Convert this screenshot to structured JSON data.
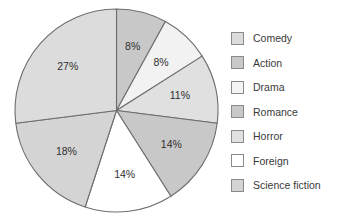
{
  "chart_data": {
    "type": "pie",
    "title": "",
    "subtitle": "",
    "xlabel": "",
    "ylabel": "",
    "grid": false,
    "legend_position": "right",
    "start_angle_deg": 90,
    "direction": "clockwise",
    "categories": [
      "Comedy",
      "Action",
      "Drama",
      "Romance",
      "Horror",
      "Foreign",
      "Science fiction"
    ],
    "values": [
      27,
      8,
      8,
      14,
      11,
      14,
      18
    ],
    "unit": "%",
    "slices": [
      {
        "label": "Action",
        "value": 8,
        "data_label": "8%",
        "color": "#c8c8c8",
        "order_clockwise": 1
      },
      {
        "label": "Drama",
        "value": 8,
        "data_label": "8%",
        "color": "#f2f2f2",
        "order_clockwise": 2
      },
      {
        "label": "Horror",
        "value": 11,
        "data_label": "11%",
        "color": "#e0e0e0",
        "order_clockwise": 3
      },
      {
        "label": "Romance",
        "value": 14,
        "data_label": "14%",
        "color": "#c8c8c8",
        "order_clockwise": 4
      },
      {
        "label": "Foreign",
        "value": 14,
        "data_label": "14%",
        "color": "#ffffff",
        "order_clockwise": 5
      },
      {
        "label": "Science fiction",
        "value": 18,
        "data_label": "18%",
        "color": "#d4d4d4",
        "order_clockwise": 6
      },
      {
        "label": "Comedy",
        "value": 27,
        "data_label": "27%",
        "color": "#dcdcdc",
        "order_clockwise": 7
      }
    ],
    "data_labels": [
      "8%",
      "8%",
      "11%",
      "14%",
      "14%",
      "18%",
      "27%"
    ],
    "outline_color": "#6e6e6e"
  },
  "legend": {
    "items": [
      {
        "label": "Comedy",
        "color": "#dcdcdc"
      },
      {
        "label": "Action",
        "color": "#c8c8c8"
      },
      {
        "label": "Drama",
        "color": "#f4f4f4"
      },
      {
        "label": "Romance",
        "color": "#c8c8c8"
      },
      {
        "label": "Horror",
        "color": "#e0e0e0"
      },
      {
        "label": "Foreign",
        "color": "#ffffff"
      },
      {
        "label": "Science fiction",
        "color": "#d4d4d4"
      }
    ]
  }
}
